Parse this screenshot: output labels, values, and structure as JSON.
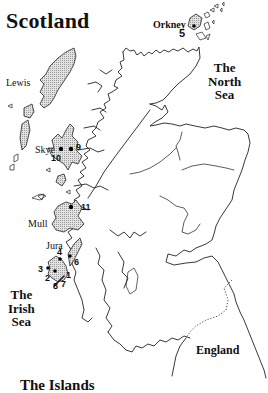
{
  "map": {
    "title": "Scotland",
    "caption": "The Islands",
    "places": {
      "lewis": "Lewis",
      "skye": "Skye",
      "mull": "Mull",
      "jura": "Jura",
      "orkney": "Orkney",
      "england": "England"
    },
    "seas": {
      "north_sea": [
        "The",
        "North",
        "Sea"
      ],
      "irish_sea": [
        "The",
        "Irish",
        "Sea"
      ]
    },
    "markers": [
      {
        "id": "1",
        "label": "1",
        "location": "Islay east"
      },
      {
        "id": "2",
        "label": "2",
        "location": "Islay south-west"
      },
      {
        "id": "3",
        "label": "3",
        "location": "Islay west"
      },
      {
        "id": "4",
        "label": "4",
        "location": "Islay north"
      },
      {
        "id": "5",
        "label": "5",
        "location": "Orkney"
      },
      {
        "id": "6",
        "label": "6",
        "location": "Jura"
      },
      {
        "id": "7",
        "label": "7",
        "location": "Islay south"
      },
      {
        "id": "8",
        "label": "8",
        "location": "Islay south"
      },
      {
        "id": "9",
        "label": "9",
        "location": "Skye east"
      },
      {
        "id": "10",
        "label": "10",
        "location": "Skye west"
      },
      {
        "id": "11",
        "label": "11",
        "location": "Mull"
      }
    ],
    "colors": {
      "ink": "#222222",
      "background": "#ffffff",
      "island_fill": "#d4d4d4"
    }
  }
}
